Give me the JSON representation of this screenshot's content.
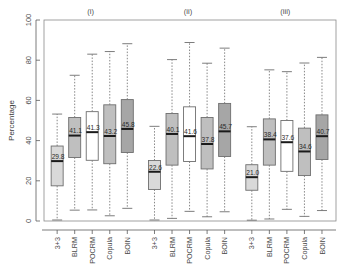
{
  "chart_data": {
    "type": "box",
    "title": "",
    "xlabel": "",
    "ylabel": "Percentage",
    "ylim": [
      0,
      100
    ],
    "yticks": [
      0,
      20,
      40,
      60,
      80,
      100
    ],
    "ytick_labels": [
      "0",
      "20",
      "40",
      "60",
      "80",
      "100"
    ],
    "grid": false,
    "legend": "none",
    "group_labels": [
      "(i)",
      "(ii)",
      "(iii)"
    ],
    "categories": [
      "3+3",
      "BLRM",
      "POCRM",
      "Copula",
      "BOIN"
    ],
    "box_fill_colors": [
      "#d9d9d9",
      "#bfbfbf",
      "#ffffff",
      "#bfbfbf",
      "#a6a6a6"
    ],
    "border_color": "#6e6e6e",
    "median_color": "#1a1a1a",
    "whisker_style": "dotted",
    "groups": [
      {
        "label": "(i)",
        "boxes": [
          {
            "category": "3+3",
            "median": 29.8,
            "median_label": "29.8",
            "q1": 17.5,
            "q3": 37.3,
            "lower": 0.5,
            "upper": 53.2,
            "fill": "#d9d9d9"
          },
          {
            "category": "BLRM",
            "median": 42.5,
            "median_label": "41.1",
            "q1": 31.6,
            "q3": 51.5,
            "lower": 5.4,
            "upper": 72.5,
            "fill": "#bfbfbf"
          },
          {
            "category": "POCRM",
            "median": 44.2,
            "median_label": "41.3",
            "q1": 30.2,
            "q3": 54.4,
            "lower": 5.5,
            "upper": 83.0,
            "fill": "#ffffff"
          },
          {
            "category": "Copula",
            "median": 42.3,
            "median_label": "43.2",
            "q1": 28.5,
            "q3": 57.8,
            "lower": 2.6,
            "upper": 84.3,
            "fill": "#bfbfbf"
          },
          {
            "category": "BOIN",
            "median": 45.8,
            "median_label": "45.8",
            "q1": 34.1,
            "q3": 60.4,
            "lower": 6.3,
            "upper": 88.2,
            "fill": "#a6a6a6"
          }
        ]
      },
      {
        "label": "(ii)",
        "boxes": [
          {
            "category": "3+3",
            "median": 24.5,
            "median_label": "22.6",
            "q1": 15.7,
            "q3": 30.1,
            "lower": 0.5,
            "upper": 47.1,
            "fill": "#d9d9d9"
          },
          {
            "category": "BLRM",
            "median": 43.3,
            "median_label": "40.1",
            "q1": 27.8,
            "q3": 53.5,
            "lower": 1.3,
            "upper": 80.3,
            "fill": "#bfbfbf"
          },
          {
            "category": "POCRM",
            "median": 42.2,
            "median_label": "41.6",
            "q1": 29.6,
            "q3": 56.8,
            "lower": 4.8,
            "upper": 88.8,
            "fill": "#ffffff"
          },
          {
            "category": "Copula",
            "median": 38.3,
            "median_label": "37.8",
            "q1": 25.9,
            "q3": 51.5,
            "lower": 2.1,
            "upper": 78.5,
            "fill": "#bfbfbf"
          },
          {
            "category": "BOIN",
            "median": 44.6,
            "median_label": "45.7",
            "q1": 32.1,
            "q3": 58.5,
            "lower": 4.6,
            "upper": 86.0,
            "fill": "#a6a6a6"
          }
        ]
      },
      {
        "label": "(iii)",
        "boxes": [
          {
            "category": "3+3",
            "median": 21.8,
            "median_label": "21.0",
            "q1": 15.3,
            "q3": 28.0,
            "lower": 0.4,
            "upper": 46.9,
            "fill": "#d9d9d9"
          },
          {
            "category": "BLRM",
            "median": 40.6,
            "median_label": "38.4",
            "q1": 27.8,
            "q3": 50.8,
            "lower": 1.0,
            "upper": 75.2,
            "fill": "#bfbfbf"
          },
          {
            "category": "POCRM",
            "median": 39.2,
            "median_label": "37.6",
            "q1": 24.7,
            "q3": 50.0,
            "lower": 5.8,
            "upper": 74.3,
            "fill": "#ffffff"
          },
          {
            "category": "Copula",
            "median": 34.6,
            "median_label": "34.6",
            "q1": 22.6,
            "q3": 46.2,
            "lower": 2.3,
            "upper": 78.6,
            "fill": "#bfbfbf"
          },
          {
            "category": "BOIN",
            "median": 42.2,
            "median_label": "40.7",
            "q1": 30.6,
            "q3": 52.8,
            "lower": 5.2,
            "upper": 81.4,
            "fill": "#a6a6a6"
          }
        ]
      }
    ]
  }
}
